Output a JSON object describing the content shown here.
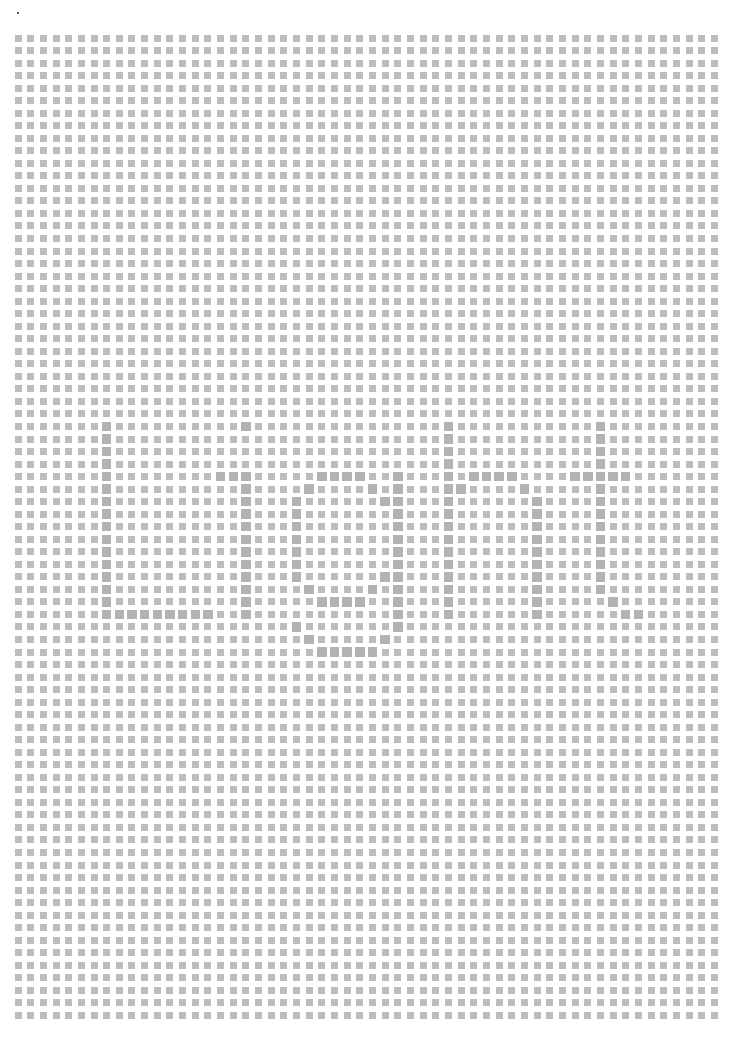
{
  "page": {
    "title": "Dot grid tracing worksheet",
    "traced_word": "Light",
    "background": "#ffffff"
  },
  "grid": {
    "columns": 56,
    "rows": 79,
    "origin_x": 18,
    "origin_y": 38,
    "step_x": 12.66,
    "step_y": 12.53,
    "square_size": 7,
    "big_square_size": 9.5,
    "square_color": "#bdbdbd",
    "big_square_color": "#b3b3b3"
  },
  "letters": [
    {
      "char": "L",
      "cells": [
        [
          7,
          31
        ],
        [
          7,
          32
        ],
        [
          7,
          33
        ],
        [
          7,
          34
        ],
        [
          7,
          35
        ],
        [
          7,
          36
        ],
        [
          7,
          37
        ],
        [
          7,
          38
        ],
        [
          7,
          39
        ],
        [
          7,
          40
        ],
        [
          7,
          41
        ],
        [
          7,
          42
        ],
        [
          7,
          43
        ],
        [
          7,
          44
        ],
        [
          7,
          45
        ],
        [
          7,
          46
        ],
        [
          8,
          46
        ],
        [
          9,
          46
        ],
        [
          10,
          46
        ],
        [
          11,
          46
        ],
        [
          12,
          46
        ],
        [
          13,
          46
        ],
        [
          14,
          46
        ],
        [
          15,
          46
        ]
      ]
    },
    {
      "char": "i",
      "cells": [
        [
          18,
          31
        ],
        [
          16,
          35
        ],
        [
          17,
          35
        ],
        [
          18,
          35
        ],
        [
          18,
          36
        ],
        [
          18,
          37
        ],
        [
          18,
          38
        ],
        [
          18,
          39
        ],
        [
          18,
          40
        ],
        [
          18,
          41
        ],
        [
          18,
          42
        ],
        [
          18,
          43
        ],
        [
          18,
          44
        ],
        [
          18,
          45
        ],
        [
          18,
          46
        ]
      ]
    },
    {
      "char": "g",
      "cells": [
        [
          24,
          35
        ],
        [
          25,
          35
        ],
        [
          26,
          35
        ],
        [
          27,
          35
        ],
        [
          30,
          35
        ],
        [
          23,
          36
        ],
        [
          28,
          36
        ],
        [
          30,
          36
        ],
        [
          22,
          37
        ],
        [
          29,
          37
        ],
        [
          30,
          37
        ],
        [
          22,
          38
        ],
        [
          30,
          38
        ],
        [
          22,
          39
        ],
        [
          30,
          39
        ],
        [
          22,
          40
        ],
        [
          30,
          40
        ],
        [
          22,
          41
        ],
        [
          30,
          41
        ],
        [
          22,
          42
        ],
        [
          30,
          42
        ],
        [
          22,
          43
        ],
        [
          29,
          43
        ],
        [
          30,
          43
        ],
        [
          23,
          44
        ],
        [
          28,
          44
        ],
        [
          30,
          44
        ],
        [
          24,
          45
        ],
        [
          25,
          45
        ],
        [
          26,
          45
        ],
        [
          27,
          45
        ],
        [
          30,
          45
        ],
        [
          30,
          46
        ],
        [
          22,
          47
        ],
        [
          30,
          47
        ],
        [
          23,
          48
        ],
        [
          29,
          48
        ],
        [
          24,
          49
        ],
        [
          25,
          49
        ],
        [
          26,
          49
        ],
        [
          27,
          49
        ],
        [
          28,
          49
        ]
      ]
    },
    {
      "char": "h",
      "cells": [
        [
          34,
          31
        ],
        [
          34,
          32
        ],
        [
          34,
          33
        ],
        [
          34,
          34
        ],
        [
          34,
          35
        ],
        [
          34,
          36
        ],
        [
          34,
          37
        ],
        [
          34,
          38
        ],
        [
          34,
          39
        ],
        [
          34,
          40
        ],
        [
          34,
          41
        ],
        [
          34,
          42
        ],
        [
          34,
          43
        ],
        [
          34,
          44
        ],
        [
          34,
          45
        ],
        [
          34,
          46
        ],
        [
          36,
          35
        ],
        [
          37,
          35
        ],
        [
          38,
          35
        ],
        [
          39,
          35
        ],
        [
          35,
          36
        ],
        [
          40,
          36
        ],
        [
          41,
          37
        ],
        [
          41,
          38
        ],
        [
          41,
          39
        ],
        [
          41,
          40
        ],
        [
          41,
          41
        ],
        [
          41,
          42
        ],
        [
          41,
          43
        ],
        [
          41,
          44
        ],
        [
          41,
          45
        ],
        [
          41,
          46
        ]
      ]
    },
    {
      "char": "t",
      "cells": [
        [
          46,
          31
        ],
        [
          46,
          32
        ],
        [
          46,
          33
        ],
        [
          46,
          34
        ],
        [
          44,
          35
        ],
        [
          45,
          35
        ],
        [
          46,
          35
        ],
        [
          47,
          35
        ],
        [
          48,
          35
        ],
        [
          46,
          36
        ],
        [
          46,
          37
        ],
        [
          46,
          38
        ],
        [
          46,
          39
        ],
        [
          46,
          40
        ],
        [
          46,
          41
        ],
        [
          46,
          42
        ],
        [
          46,
          43
        ],
        [
          46,
          44
        ],
        [
          47,
          45
        ],
        [
          48,
          46
        ],
        [
          49,
          46
        ]
      ]
    }
  ]
}
